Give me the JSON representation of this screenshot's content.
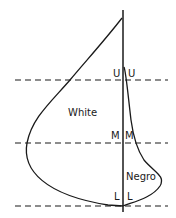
{
  "diagram": {
    "type": "comparative distribution outline",
    "regions": {
      "white_label": "White",
      "negro_label": "Negro"
    },
    "levels": {
      "upper": {
        "left": "U",
        "right": "U"
      },
      "middle": {
        "left": "M",
        "right": "M"
      },
      "lower": {
        "left": "L",
        "right": "L"
      }
    },
    "colors": {
      "line": "#1a1a1a",
      "background": "#ffffff"
    }
  }
}
